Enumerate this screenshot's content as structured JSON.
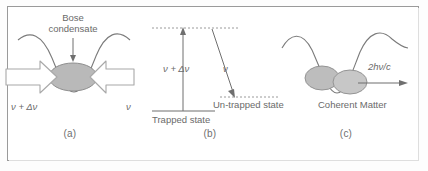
{
  "figure": {
    "panels": [
      {
        "caption": "(a)",
        "condensate_label_line1": "Bose",
        "condensate_label_line2": "condensate",
        "left_beam_label": "ν + Δν",
        "right_beam_label": "ν"
      },
      {
        "caption": "(b)",
        "up_transition_label": "ν + Δν",
        "down_transition_label": "ν",
        "lower_state_label": "Trapped state",
        "upper_state_label": "Un-trapped state"
      },
      {
        "caption": "(c)",
        "output_label": "2hν/c",
        "matter_label": "Coherent Matter"
      }
    ]
  },
  "colors": {
    "border": "#9a9a9a",
    "line": "#7b7b7b",
    "text": "#6a6a6a",
    "blob_fill": "#b9b9b9",
    "blob_stroke": "#8f8f8f",
    "arrow_fill": "#ffffff",
    "arrow_stroke": "#a8a8a8",
    "background": "#ffffff"
  }
}
